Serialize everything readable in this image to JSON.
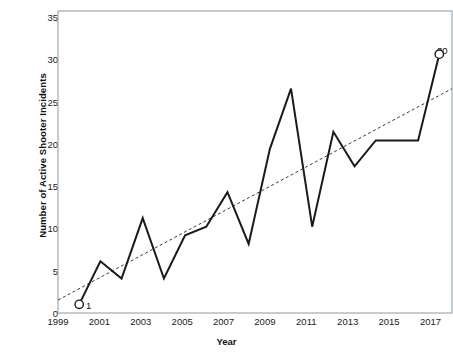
{
  "chart_data": {
    "type": "line",
    "title": "",
    "xlabel": "Year",
    "ylabel": "Number of Active Shooter Incidents",
    "x": [
      2000,
      2001,
      2002,
      2003,
      2004,
      2005,
      2006,
      2007,
      2008,
      2009,
      2010,
      2011,
      2012,
      2013,
      2014,
      2015,
      2016,
      2017
    ],
    "values": [
      1,
      6,
      4,
      11,
      4,
      9,
      10,
      14,
      8,
      19,
      26,
      10,
      21,
      17,
      20,
      20,
      20,
      30
    ],
    "series": [
      {
        "name": "Active Shooter Incidents",
        "values": [
          1,
          6,
          4,
          11,
          4,
          9,
          10,
          14,
          8,
          19,
          26,
          10,
          21,
          17,
          20,
          20,
          20,
          30
        ],
        "style": "solid",
        "color": "#1a1a1a"
      },
      {
        "name": "Linear trend",
        "style": "dashed",
        "color": "#3b3b3b",
        "x_endpoints": [
          1999.0,
          2017.6
        ],
        "y_endpoints": [
          1.5,
          26.0
        ]
      }
    ],
    "xlim": [
      1999.0,
      2017.6
    ],
    "ylim": [
      0,
      35
    ],
    "xticks": [
      1999,
      2001,
      2003,
      2005,
      2007,
      2009,
      2011,
      2013,
      2015,
      2017
    ],
    "xticklabels": [
      "1999",
      "2001",
      "2003",
      "2005",
      "2007",
      "2009",
      "2011",
      "2013",
      "2015",
      "2017"
    ],
    "yticks": [
      0,
      5,
      10,
      15,
      20,
      25,
      30,
      35
    ],
    "yticklabels": [
      "0",
      "5",
      "10",
      "15",
      "20",
      "25",
      "30",
      "35"
    ],
    "grid": false,
    "legend": "none",
    "annotations": [
      {
        "name": "first-point-label",
        "text": "1",
        "x": 2000,
        "y": 1,
        "marker": "open-circle"
      },
      {
        "name": "last-point-label",
        "text": "30",
        "x": 2017,
        "y": 30,
        "marker": "open-circle"
      }
    ],
    "colors": {
      "line": "#1a1a1a",
      "trendline": "#3b3b3b",
      "axis": "#8a98a8",
      "text": "#111111",
      "background": "#ffffff"
    }
  }
}
